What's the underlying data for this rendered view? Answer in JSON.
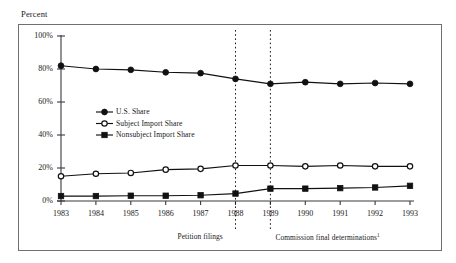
{
  "figure": {
    "axis_title": "Percent"
  },
  "chart_data": {
    "type": "line",
    "title": "",
    "subtitle": "",
    "xlabel": "",
    "ylabel": "Percent",
    "grid": false,
    "legend_position": "inside-left",
    "categories": [
      "1983",
      "1984",
      "1985",
      "1986",
      "1987",
      "1988",
      "1989",
      "1990",
      "1991",
      "1992",
      "1993"
    ],
    "x": [
      1983,
      1984,
      1985,
      1986,
      1987,
      1988,
      1989,
      1990,
      1991,
      1992,
      1993
    ],
    "xlim": [
      1983,
      1993
    ],
    "ylim": [
      0,
      100
    ],
    "ytick_labels": [
      "0%",
      "20%",
      "40%",
      "60%",
      "80%",
      "100%"
    ],
    "yticks": [
      0,
      20,
      40,
      60,
      80,
      100
    ],
    "series": [
      {
        "name": "U.S. Share",
        "marker": "filled-circle",
        "color": "#111111",
        "values": [
          82,
          80,
          79.5,
          78,
          77.5,
          74,
          71,
          72,
          71,
          71.5,
          71
        ]
      },
      {
        "name": "Subject Import Share",
        "marker": "open-circle",
        "color": "#111111",
        "values": [
          15,
          16.5,
          17,
          19,
          19.5,
          21.5,
          21.5,
          21,
          21.5,
          21,
          21
        ]
      },
      {
        "name": "Nonsubject Import Share",
        "marker": "filled-square",
        "color": "#111111",
        "values": [
          3,
          3,
          3.2,
          3.2,
          3.5,
          4.5,
          7.5,
          7.5,
          7.8,
          8.2,
          9.2
        ]
      }
    ],
    "annotations": [
      {
        "label": "Petition filings",
        "x": 1988,
        "style": "dotted-vline"
      },
      {
        "label": "Commission final determinations",
        "footnote": "1",
        "x": 1989,
        "style": "dotted-vline"
      }
    ]
  }
}
